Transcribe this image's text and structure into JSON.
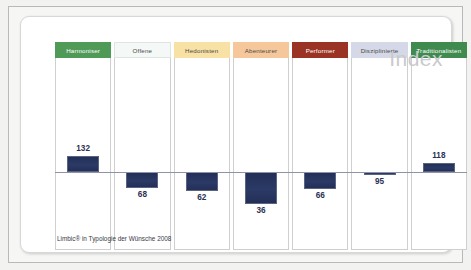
{
  "card": {
    "watermark": "Index",
    "footer": "Limbic® in Typologie der Wünsche 2008"
  },
  "chart_data": {
    "type": "bar",
    "title": "",
    "subtitle": "",
    "xlabel": "",
    "ylabel": "Index",
    "baseline": 100,
    "grid": false,
    "legend": "none",
    "annotations": [
      "Index",
      "Limbic® in Typologie der Wünsche 2008"
    ],
    "categories": [
      "Harmoniser",
      "Offene",
      "Hedonisten",
      "Abenteurer",
      "Performer",
      "Disziplinierte",
      "Traditionalisten"
    ],
    "values": [
      132,
      68,
      62,
      36,
      66,
      95,
      118
    ],
    "ylim": [
      0,
      160
    ],
    "header_colors": [
      "#4e9a56",
      "#f4f8f6",
      "#f7e1a4",
      "#f6c79a",
      "#9a3324",
      "#d5d8e6",
      "#3f8a4e"
    ],
    "header_text_colors": [
      "#ffffff",
      "#4a4a4a",
      "#4a4a4a",
      "#4a4a4a",
      "#ffffff",
      "#4a4a4a",
      "#ffffff"
    ],
    "bar_color": "#26345e",
    "bars": [
      {
        "category": "Harmoniser",
        "value": 132,
        "label": "132",
        "direction": "up",
        "label_position": "above"
      },
      {
        "category": "Offene",
        "value": 68,
        "label": "68",
        "direction": "down",
        "label_position": "below"
      },
      {
        "category": "Hedonisten",
        "value": 62,
        "label": "62",
        "direction": "down",
        "label_position": "below"
      },
      {
        "category": "Abenteurer",
        "value": 36,
        "label": "36",
        "direction": "down",
        "label_position": "below"
      },
      {
        "category": "Performer",
        "value": 66,
        "label": "66",
        "direction": "down",
        "label_position": "below"
      },
      {
        "category": "Disziplinierte",
        "value": 95,
        "label": "95",
        "direction": "down",
        "label_position": "below"
      },
      {
        "category": "Traditionalisten",
        "value": 118,
        "label": "118",
        "direction": "up",
        "label_position": "above"
      }
    ]
  }
}
